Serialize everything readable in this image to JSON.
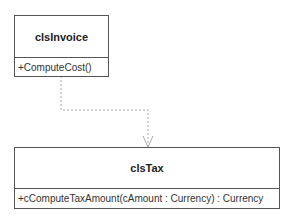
{
  "diagram": {
    "type": "UML class diagram",
    "classes": [
      {
        "name": "clsInvoice",
        "operations": [
          "+ComputeCost()"
        ]
      },
      {
        "name": "clsTax",
        "operations": [
          "+cComputeTaxAmount(cAmount : Currency) : Currency"
        ]
      }
    ],
    "relationships": [
      {
        "from": "clsInvoice",
        "to": "clsTax",
        "kind": "dependency",
        "style": "dashed",
        "arrow": "open"
      }
    ],
    "colors": {
      "border": "#555555",
      "connector": "#aaaaaa",
      "text": "#222222"
    }
  }
}
